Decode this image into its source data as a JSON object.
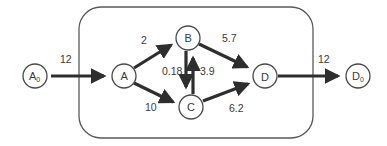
{
  "diagram": {
    "type": "flow-network",
    "boundary": {
      "x": 79,
      "y": 7,
      "width": 234,
      "height": 131,
      "radius": 22
    },
    "colors": {
      "stroke": "#2e2e2e",
      "node_border": "#4a4a4a",
      "text": "#3a3a3a",
      "background": "#ffffff"
    },
    "nodes": [
      {
        "id": "A0",
        "label": "A",
        "subscript": "0",
        "x": 35,
        "y": 76
      },
      {
        "id": "A",
        "label": "A",
        "subscript": "",
        "x": 124,
        "y": 76
      },
      {
        "id": "B",
        "label": "B",
        "subscript": "",
        "x": 188,
        "y": 38
      },
      {
        "id": "C",
        "label": "C",
        "subscript": "",
        "x": 191,
        "y": 107
      },
      {
        "id": "D",
        "label": "D",
        "subscript": "",
        "x": 265,
        "y": 76
      },
      {
        "id": "D0",
        "label": "D",
        "subscript": "0",
        "x": 358,
        "y": 76
      }
    ],
    "edges": [
      {
        "from": "A0",
        "to": "A",
        "value": "12",
        "label_x": 60,
        "label_y": 63
      },
      {
        "from": "A",
        "to": "B",
        "value": "2",
        "label_x": 141,
        "label_y": 44
      },
      {
        "from": "A",
        "to": "C",
        "value": "10",
        "label_x": 145,
        "label_y": 111
      },
      {
        "from": "B",
        "to": "C",
        "value": "0.18",
        "label_x": 162,
        "label_y": 75
      },
      {
        "from": "C",
        "to": "B",
        "value": "3.9",
        "label_x": 200,
        "label_y": 75
      },
      {
        "from": "B",
        "to": "D",
        "value": "5.7",
        "label_x": 222,
        "label_y": 42
      },
      {
        "from": "C",
        "to": "D",
        "value": "6.2",
        "label_x": 229,
        "label_y": 112
      },
      {
        "from": "D",
        "to": "D0",
        "value": "12",
        "label_x": 318,
        "label_y": 63
      }
    ]
  }
}
